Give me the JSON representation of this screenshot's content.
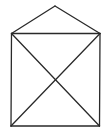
{
  "diagram": {
    "type": "house-envelope",
    "stroke_color": "#2a2a2a",
    "background": "#ffffff",
    "points": {
      "apex": [
        55,
        6
      ],
      "top_left": [
        11.5,
        33.5
      ],
      "top_right": [
        100,
        33.5
      ],
      "bottom_left": [
        11,
        126
      ],
      "bottom_right": [
        99.5,
        126
      ]
    },
    "edges": [
      [
        "apex",
        "top_left"
      ],
      [
        "apex",
        "top_right"
      ],
      [
        "top_left",
        "top_right"
      ],
      [
        "top_left",
        "bottom_left"
      ],
      [
        "top_right",
        "bottom_right"
      ],
      [
        "bottom_left",
        "bottom_right"
      ],
      [
        "top_left",
        "bottom_right"
      ],
      [
        "top_right",
        "bottom_left"
      ]
    ]
  }
}
